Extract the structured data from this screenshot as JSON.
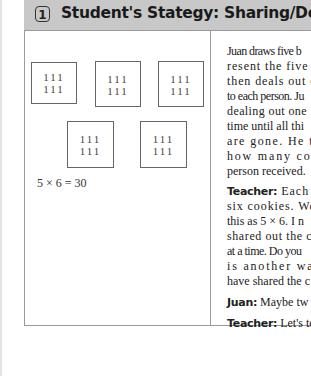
{
  "header": {
    "number": "1",
    "title": "Student's Stategy: Sharing/Dealing Out"
  },
  "drawing": {
    "boxes": [
      {
        "row1": "111",
        "row2": "111"
      },
      {
        "row1": "111",
        "row2": "111"
      },
      {
        "row1": "111",
        "row2": "111"
      },
      {
        "row1": "111",
        "row2": "111"
      },
      {
        "row1": "111",
        "row2": "111"
      }
    ],
    "equation": "5 × 6 = 30"
  },
  "narrative": {
    "lines": [
      "Juan draws five b",
      "resent the five f",
      "then deals out o",
      "to each person. Ju",
      "dealing out one",
      "time until all thi",
      "are gone. He th",
      "how many coo",
      "person received."
    ]
  },
  "dialogue": [
    {
      "speaker": "Teacher:",
      "lines": [
        " Each p",
        "six cookies. We",
        "this as 5 × 6. I n",
        "shared out the c",
        "at a time. Do you",
        "is another way",
        "have shared the c"
      ]
    },
    {
      "speaker": "Juan:",
      "lines": [
        " Maybe tw"
      ]
    },
    {
      "speaker": "Teacher:",
      "lines": [
        " Let's te"
      ]
    }
  ]
}
